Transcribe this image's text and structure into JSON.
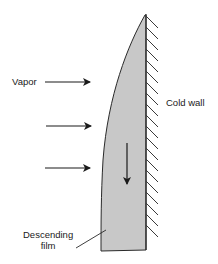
{
  "diagram": {
    "type": "film condensation on a vertical cold wall",
    "labels": {
      "vapor": "Vapor",
      "cold_wall": "Cold wall",
      "film_line1": "Descending",
      "film_line2": "film"
    },
    "vapor_arrows": {
      "count": 3,
      "direction": "right"
    },
    "film_flow_arrow": {
      "direction": "down"
    },
    "colors": {
      "film_fill": "#c8c8c8",
      "outline": "#2a2a2a",
      "hatch": "#3a3a3a",
      "text": "#1a1a1a",
      "background": "#ffffff"
    }
  }
}
